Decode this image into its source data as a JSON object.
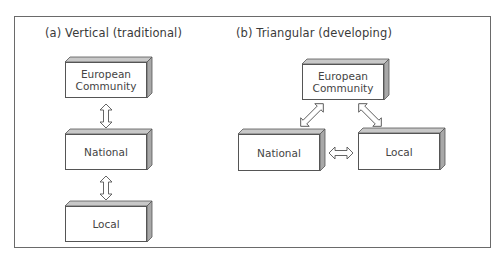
{
  "diagram": {
    "panels": [
      {
        "id": "a",
        "caption": "(a)  Vertical (traditional)",
        "nodes": [
          {
            "label_lines": [
              "European",
              "Community"
            ]
          },
          {
            "label_lines": [
              "National"
            ]
          },
          {
            "label_lines": [
              "Local"
            ]
          }
        ],
        "edges": [
          {
            "from": "European Community",
            "to": "National",
            "type": "bidirectional"
          },
          {
            "from": "National",
            "to": "Local",
            "type": "bidirectional"
          }
        ]
      },
      {
        "id": "b",
        "caption": "(b)  Triangular (developing)",
        "nodes": [
          {
            "label_lines": [
              "European",
              "Community"
            ]
          },
          {
            "label_lines": [
              "National"
            ]
          },
          {
            "label_lines": [
              "Local"
            ]
          }
        ],
        "edges": [
          {
            "from": "European Community",
            "to": "National",
            "type": "bidirectional"
          },
          {
            "from": "European Community",
            "to": "Local",
            "type": "bidirectional"
          },
          {
            "from": "National",
            "to": "Local",
            "type": "bidirectional"
          }
        ]
      }
    ],
    "colors": {
      "outline": "#555555",
      "box_side": "#a8a8a8",
      "box_top": "#c8c8c8",
      "text": "#3a3a3a"
    }
  }
}
